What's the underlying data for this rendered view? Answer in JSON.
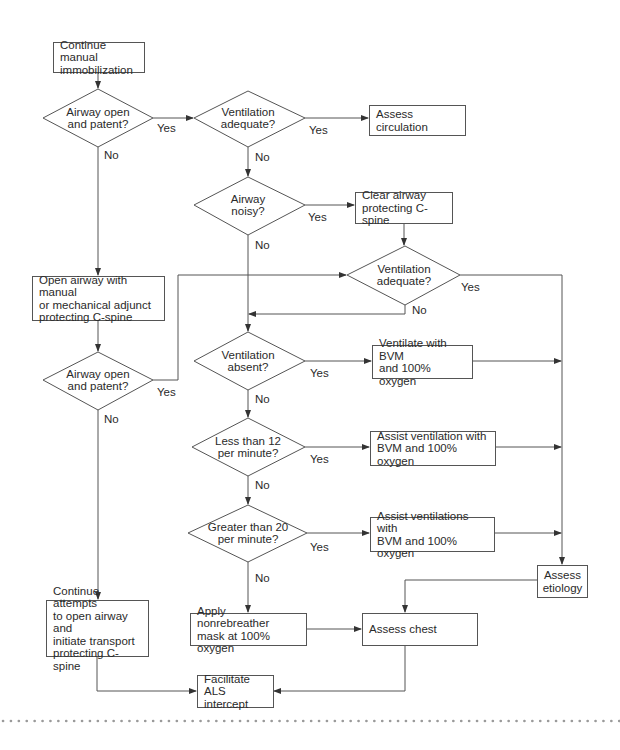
{
  "diagram": {
    "type": "flowchart",
    "colors": {
      "line": "#555555",
      "text": "#2a2a2a",
      "background": "#ffffff",
      "dots": "#9a9a9a"
    },
    "nodes": {
      "continue_immobilization": {
        "shape": "box",
        "text": "Continue manual\nimmobilization"
      },
      "airway_open_1": {
        "shape": "diamond",
        "text": "Airway open\nand patent?"
      },
      "ventilation_adequate_1": {
        "shape": "diamond",
        "text": "Ventilation\nadequate?"
      },
      "assess_circulation": {
        "shape": "box",
        "text": "Assess circulation"
      },
      "airway_noisy": {
        "shape": "diamond",
        "text": "Airway\nnoisy?"
      },
      "clear_airway": {
        "shape": "box",
        "text": "Clear airway\nprotecting C-spine"
      },
      "ventilation_adequate_2": {
        "shape": "diamond",
        "text": "Ventilation\nadequate?"
      },
      "open_airway": {
        "shape": "box",
        "text": "Open airway with manual\nor mechanical adjunct\nprotecting C-spine"
      },
      "airway_open_2": {
        "shape": "diamond",
        "text": "Airway open\nand patent?"
      },
      "ventilation_absent": {
        "shape": "diamond",
        "text": "Ventilation\nabsent?"
      },
      "ventilate_bvm": {
        "shape": "box",
        "text": "Ventilate with BVM\nand 100% oxygen"
      },
      "less_than_12": {
        "shape": "diamond",
        "text": "Less than 12\nper minute?"
      },
      "assist_ventilation": {
        "shape": "box",
        "text": "Assist ventilation with\nBVM and 100% oxygen"
      },
      "greater_than_20": {
        "shape": "diamond",
        "text": "Greater than 20\nper minute?"
      },
      "assist_ventilations": {
        "shape": "box",
        "text": "Assist ventilations with\nBVM and 100% oxygen"
      },
      "assess_etiology": {
        "shape": "box",
        "text": "Assess\netiology"
      },
      "continue_attempts": {
        "shape": "box",
        "text": "Continue attempts\nto open airway and\ninitiate transport\nprotecting C-spine"
      },
      "apply_nonrebreather": {
        "shape": "box",
        "text": "Apply nonrebreather\nmask at 100% oxygen"
      },
      "assess_chest": {
        "shape": "box",
        "text": "Assess chest"
      },
      "facilitate_als": {
        "shape": "box",
        "text": "Facilitate ALS\nintercept"
      }
    },
    "edge_labels": {
      "yes": "Yes",
      "no": "No"
    },
    "edges": [
      {
        "from": "continue_immobilization",
        "to": "airway_open_1",
        "label": ""
      },
      {
        "from": "airway_open_1",
        "to": "ventilation_adequate_1",
        "label": "Yes"
      },
      {
        "from": "airway_open_1",
        "to": "open_airway",
        "label": "No"
      },
      {
        "from": "ventilation_adequate_1",
        "to": "assess_circulation",
        "label": "Yes"
      },
      {
        "from": "ventilation_adequate_1",
        "to": "airway_noisy",
        "label": "No"
      },
      {
        "from": "airway_noisy",
        "to": "clear_airway",
        "label": "Yes"
      },
      {
        "from": "airway_noisy",
        "to": "ventilation_absent",
        "label": "No"
      },
      {
        "from": "clear_airway",
        "to": "ventilation_adequate_2",
        "label": ""
      },
      {
        "from": "ventilation_adequate_2",
        "to": "assess_etiology",
        "label": "Yes"
      },
      {
        "from": "ventilation_adequate_2",
        "to": "ventilation_absent",
        "label": "No"
      },
      {
        "from": "open_airway",
        "to": "airway_open_2",
        "label": ""
      },
      {
        "from": "airway_open_2",
        "to": "ventilation_adequate_2",
        "label": "Yes"
      },
      {
        "from": "airway_open_2",
        "to": "continue_attempts",
        "label": "No"
      },
      {
        "from": "ventilation_absent",
        "to": "ventilate_bvm",
        "label": "Yes"
      },
      {
        "from": "ventilation_absent",
        "to": "less_than_12",
        "label": "No"
      },
      {
        "from": "ventilate_bvm",
        "to": "assess_etiology",
        "label": ""
      },
      {
        "from": "less_than_12",
        "to": "assist_ventilation",
        "label": "Yes"
      },
      {
        "from": "less_than_12",
        "to": "greater_than_20",
        "label": "No"
      },
      {
        "from": "assist_ventilation",
        "to": "assess_etiology",
        "label": ""
      },
      {
        "from": "greater_than_20",
        "to": "assist_ventilations",
        "label": "Yes"
      },
      {
        "from": "greater_than_20",
        "to": "apply_nonrebreather",
        "label": "No"
      },
      {
        "from": "assist_ventilations",
        "to": "assess_etiology",
        "label": ""
      },
      {
        "from": "assess_etiology",
        "to": "assess_chest",
        "label": ""
      },
      {
        "from": "apply_nonrebreather",
        "to": "assess_chest",
        "label": ""
      },
      {
        "from": "continue_attempts",
        "to": "facilitate_als",
        "label": ""
      },
      {
        "from": "assess_chest",
        "to": "facilitate_als",
        "label": ""
      }
    ]
  }
}
